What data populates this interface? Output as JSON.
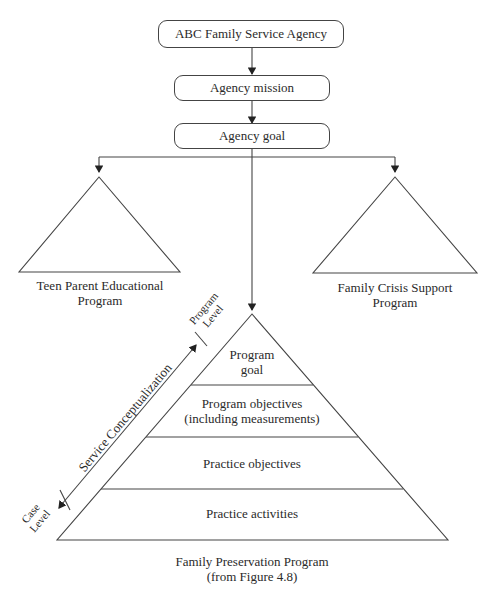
{
  "diagram": {
    "agency": "ABC Family Service Agency",
    "mission": "Agency mission",
    "goal": "Agency goal",
    "left_program": {
      "line1": "Teen Parent Educational",
      "line2": "Program"
    },
    "right_program": {
      "line1": "Family Crisis Support",
      "line2": "Program"
    },
    "pyramid": {
      "levels": [
        {
          "line1": "Program",
          "line2": "goal"
        },
        {
          "line1": "Program objectives",
          "line2": "(including measurements)"
        },
        {
          "line1": "Practice objectives"
        },
        {
          "line1": "Practice activities"
        }
      ],
      "caption_line1": "Family Preservation Program",
      "caption_line2": "(from Figure 4.8)"
    },
    "axis": {
      "label": "Service Conceptualization",
      "top_end": {
        "line1": "Program",
        "line2": "Level"
      },
      "bottom_end": {
        "line1": "Case",
        "line2": "Level"
      }
    }
  }
}
